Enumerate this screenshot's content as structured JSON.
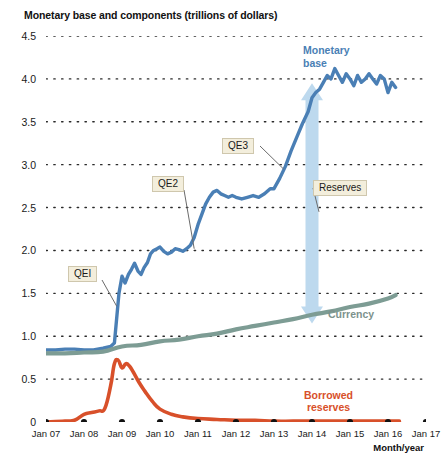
{
  "chart_data": {
    "type": "line",
    "title": "Monetary base and components (trillions of dollars)",
    "xlabel": "Month/year",
    "ylabel": "",
    "ylim": [
      0,
      4.5
    ],
    "yticks": [
      "0",
      "0.5",
      "1.0",
      "1.5",
      "2.0",
      "2.5",
      "3.0",
      "3.5",
      "4.0",
      "4.5"
    ],
    "ytick_values": [
      0,
      0.5,
      1.0,
      1.5,
      2.0,
      2.5,
      3.0,
      3.5,
      4.0,
      4.5
    ],
    "grid": "dotted-horizontal",
    "legend": "inline-annotations",
    "categories": [
      "Jan 07",
      "Jan 08",
      "Jan 09",
      "Jan 10",
      "Jan 11",
      "Jan 12",
      "Jan 13",
      "Jan 14",
      "Jan 15",
      "Jan 16",
      "Jan 17"
    ],
    "xlim": [
      2007.0,
      2017.0
    ],
    "series": [
      {
        "name": "Monetary base",
        "color": "#4a7fb5",
        "x": [
          2007.0,
          2007.25,
          2007.5,
          2007.75,
          2008.0,
          2008.25,
          2008.5,
          2008.7,
          2008.8,
          2008.92,
          2009.0,
          2009.08,
          2009.17,
          2009.25,
          2009.33,
          2009.42,
          2009.5,
          2009.58,
          2009.67,
          2009.75,
          2009.83,
          2009.92,
          2010.0,
          2010.1,
          2010.2,
          2010.3,
          2010.4,
          2010.5,
          2010.6,
          2010.7,
          2010.8,
          2010.9,
          2011.0,
          2011.1,
          2011.2,
          2011.3,
          2011.4,
          2011.5,
          2011.6,
          2011.7,
          2011.8,
          2011.9,
          2012.0,
          2012.15,
          2012.3,
          2012.45,
          2012.6,
          2012.75,
          2012.9,
          2013.0,
          2013.15,
          2013.3,
          2013.45,
          2013.6,
          2013.75,
          2013.9,
          2014.0,
          2014.1,
          2014.2,
          2014.3,
          2014.4,
          2014.5,
          2014.6,
          2014.7,
          2014.8,
          2014.9,
          2015.0,
          2015.1,
          2015.2,
          2015.3,
          2015.4,
          2015.5,
          2015.6,
          2015.7,
          2015.8,
          2015.9,
          2016.0,
          2016.1,
          2016.2
        ],
        "y": [
          0.84,
          0.84,
          0.85,
          0.85,
          0.84,
          0.84,
          0.86,
          0.88,
          0.92,
          1.5,
          1.7,
          1.62,
          1.72,
          1.78,
          1.85,
          1.76,
          1.72,
          1.8,
          1.86,
          1.96,
          2.0,
          2.02,
          2.04,
          1.99,
          1.96,
          1.98,
          2.02,
          2.01,
          1.99,
          2.02,
          2.06,
          2.15,
          2.3,
          2.42,
          2.54,
          2.62,
          2.68,
          2.7,
          2.66,
          2.64,
          2.62,
          2.64,
          2.62,
          2.6,
          2.62,
          2.64,
          2.62,
          2.66,
          2.72,
          2.72,
          2.84,
          2.98,
          3.16,
          3.32,
          3.48,
          3.62,
          3.78,
          3.84,
          3.88,
          3.96,
          4.04,
          4.0,
          4.12,
          4.04,
          3.96,
          4.06,
          4.0,
          3.92,
          4.04,
          3.96,
          4.0,
          4.06,
          4.0,
          3.94,
          4.04,
          4.0,
          3.84,
          3.96,
          3.9
        ],
        "note": "Peaks near 4.1 trillion in 2014-2015, ends near 3.9"
      },
      {
        "name": "Currency",
        "color": "#7d9c94",
        "x": [
          2007.0,
          2007.5,
          2008.0,
          2008.5,
          2009.0,
          2009.5,
          2010.0,
          2010.5,
          2011.0,
          2011.5,
          2012.0,
          2012.5,
          2013.0,
          2013.5,
          2014.0,
          2014.5,
          2015.0,
          2015.5,
          2016.0,
          2016.2
        ],
        "y": [
          0.8,
          0.8,
          0.81,
          0.82,
          0.88,
          0.9,
          0.94,
          0.96,
          1.0,
          1.03,
          1.08,
          1.12,
          1.16,
          1.2,
          1.25,
          1.29,
          1.34,
          1.38,
          1.44,
          1.48
        ]
      },
      {
        "name": "Borrowed reserves",
        "color": "#d8502a",
        "x": [
          2007.0,
          2007.5,
          2007.75,
          2008.0,
          2008.2,
          2008.4,
          2008.55,
          2008.7,
          2008.8,
          2008.9,
          2009.0,
          2009.1,
          2009.2,
          2009.3,
          2009.45,
          2009.6,
          2009.8,
          2010.0,
          2010.3,
          2010.6,
          2011.0,
          2011.5,
          2012.0,
          2012.5,
          2013.0,
          2013.5,
          2014.0,
          2014.5,
          2015.0,
          2015.5,
          2016.0,
          2016.3
        ],
        "y": [
          0.0,
          0.01,
          0.02,
          0.09,
          0.11,
          0.13,
          0.16,
          0.42,
          0.68,
          0.72,
          0.63,
          0.68,
          0.65,
          0.58,
          0.46,
          0.36,
          0.24,
          0.15,
          0.09,
          0.06,
          0.04,
          0.03,
          0.02,
          0.02,
          0.01,
          0.01,
          0.01,
          0.01,
          0.01,
          0.01,
          0.01,
          0.01
        ],
        "note": "Peak approximately 0.72 trillion in late 2008"
      }
    ],
    "annotations": [
      {
        "id": "qe1",
        "text": "QEI",
        "type": "boxed-callout",
        "points_to": "Monetary base steep rise late 2008"
      },
      {
        "id": "qe2",
        "text": "QE2",
        "type": "boxed-callout",
        "points_to": "Monetary base rise late 2010"
      },
      {
        "id": "qe3",
        "text": "QE3",
        "type": "boxed-callout",
        "points_to": "Monetary base rise 2013"
      },
      {
        "id": "reserves",
        "text": "Reserves",
        "type": "boxed-callout",
        "points_to": "vertical arrow span between currency and monetary base"
      },
      {
        "id": "monetary-base",
        "text": "Monetary base",
        "type": "series-label",
        "color": "#4a7fb5"
      },
      {
        "id": "currency",
        "text": "Currency",
        "type": "series-label",
        "color": "#7d9c94"
      },
      {
        "id": "borrowed-reserves",
        "text": "Borrowed reserves",
        "type": "series-label",
        "color": "#d8502a"
      },
      {
        "id": "reserves-arrow",
        "text": "",
        "type": "double-headed-arrow",
        "from_y": 3.95,
        "to_y": 1.15,
        "at_x": 2014.0,
        "color": "#bdd9ee"
      }
    ]
  },
  "labels": {
    "monetary_base_line1": "Monetary",
    "monetary_base_line2": "base",
    "reserves": "Reserves",
    "currency": "Currency",
    "borrowed_line1": "Borrowed",
    "borrowed_line2": "reserves",
    "qe1": "QEI",
    "qe2": "QE2",
    "qe3": "QE3",
    "xaxis_title": "Month/year"
  }
}
